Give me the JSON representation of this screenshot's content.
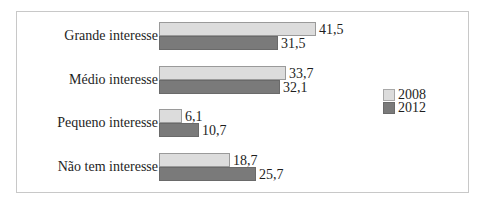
{
  "chart_data": {
    "type": "bar",
    "orientation": "horizontal",
    "title": "",
    "xlabel": "",
    "ylabel": "",
    "categories": [
      "Grande interesse",
      "Médio interesse",
      "Pequeno interesse",
      "Não tem interesse"
    ],
    "series": [
      {
        "name": "2008",
        "color": "#dcdcdc",
        "values": [
          41.5,
          33.7,
          6.1,
          18.7
        ],
        "labels": [
          "41,5",
          "33,7",
          "6,1",
          "18,7"
        ]
      },
      {
        "name": "2012",
        "color": "#7a7a7a",
        "values": [
          31.5,
          32.1,
          10.7,
          25.7
        ],
        "labels": [
          "31,5",
          "32,1",
          "10,7",
          "25,7"
        ]
      }
    ],
    "xlim": [
      0,
      45
    ],
    "grid": false,
    "legend_position": "right",
    "data_labels": true
  },
  "legend": {
    "items": [
      {
        "label": "2008",
        "color": "#dcdcdc"
      },
      {
        "label": "2012",
        "color": "#7a7a7a"
      }
    ]
  }
}
